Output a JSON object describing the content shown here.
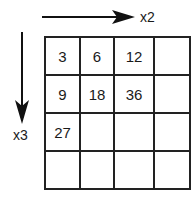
{
  "horizontal_arrow": {
    "label": "x2",
    "direction": "right"
  },
  "vertical_arrow": {
    "label": "x3",
    "direction": "down"
  },
  "grid": {
    "rows": [
      [
        "3",
        "6",
        "12",
        ""
      ],
      [
        "9",
        "18",
        "36",
        ""
      ],
      [
        "27",
        "",
        "",
        ""
      ],
      [
        "",
        "",
        "",
        ""
      ]
    ]
  }
}
